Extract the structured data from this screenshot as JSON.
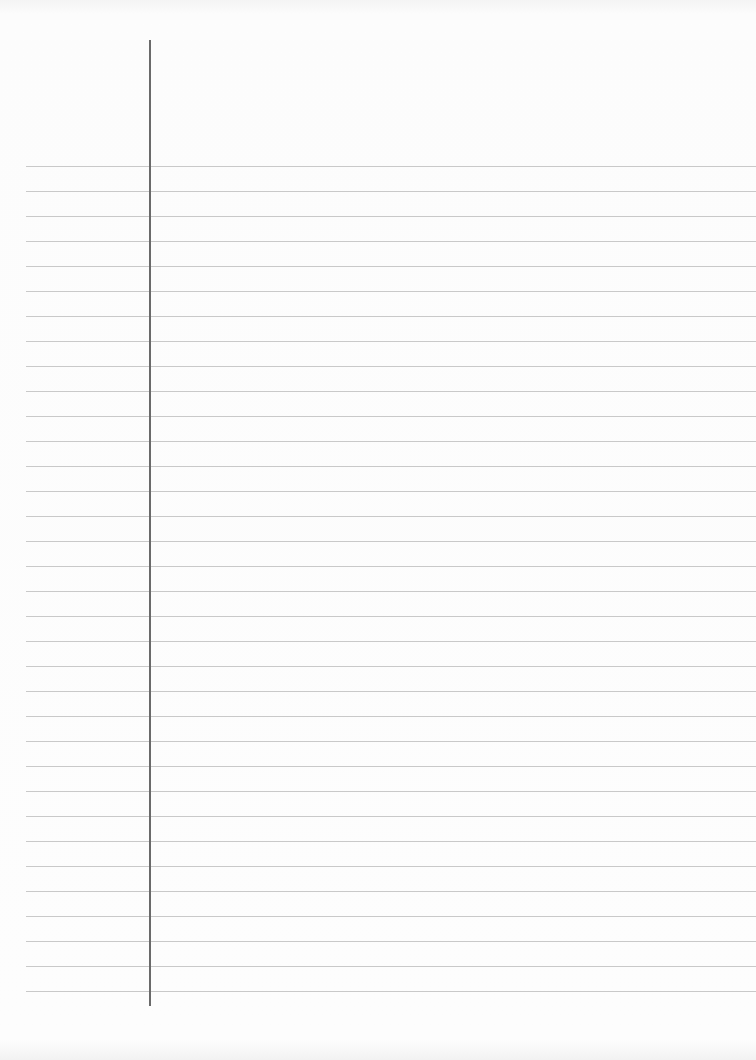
{
  "document": {
    "type": "lined-paper",
    "content": "",
    "rule_count": 34,
    "first_rule_y": 166,
    "rule_spacing": 25,
    "margin_line_x": 149,
    "colors": {
      "paper": "#fbfbfb",
      "rule": "#c9c9c9",
      "margin_line": "#6a6a6a"
    }
  }
}
